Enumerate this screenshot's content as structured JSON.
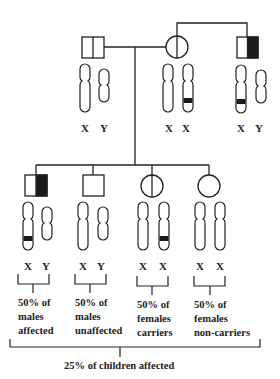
{
  "diagram": {
    "type": "x-linked-recessive-pedigree",
    "colors": {
      "stroke": "#222222",
      "fill_affected": "#1a1a1a",
      "background": "#ffffff"
    },
    "parents": {
      "father": {
        "symbol": "square-half-vertical-line",
        "status": "unaffected",
        "chromosomes": [
          "X",
          "Y"
        ]
      },
      "mother": {
        "symbol": "circle-vertical-line",
        "status": "carrier",
        "chromosomes": [
          "X",
          "X"
        ]
      },
      "maternal_grandfather": {
        "symbol": "square-right-half-filled",
        "status": "affected",
        "chromosomes": [
          "X",
          "Y"
        ]
      }
    },
    "labels": {
      "father_x": "X",
      "father_y": "Y",
      "mother_x1": "X",
      "mother_x2": "X",
      "grandfather_x": "X",
      "grandfather_y": "Y",
      "child1_x": "X",
      "child1_y": "Y",
      "child2_x": "X",
      "child2_y": "Y",
      "child3_x1": "X",
      "child3_x2": "X",
      "child4_x1": "X",
      "child4_x2": "X"
    },
    "children": [
      {
        "symbol": "square-right-half-filled",
        "status": "affected male",
        "desc": [
          "50% of",
          "males",
          "affected"
        ]
      },
      {
        "symbol": "square-empty",
        "status": "unaffected male",
        "desc": [
          "50% of",
          "males",
          "unaffected"
        ]
      },
      {
        "symbol": "circle-vertical-line",
        "status": "carrier female",
        "desc": [
          "50% of",
          "females",
          "carriers"
        ]
      },
      {
        "symbol": "circle-empty",
        "status": "non-carrier female",
        "desc": [
          "50% of",
          "females",
          "non-carriers"
        ]
      }
    ],
    "summary": "25% of children affected"
  }
}
